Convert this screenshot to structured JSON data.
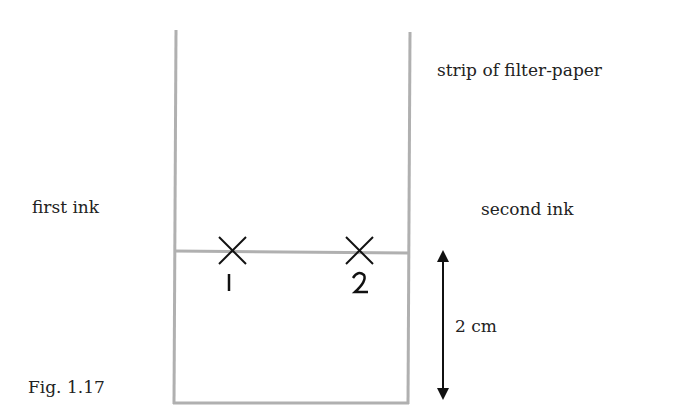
{
  "figure": {
    "caption": "Fig. 1.17",
    "labels": {
      "strip": "strip of filter-paper",
      "first_ink": "first ink",
      "second_ink": "second ink",
      "distance": "2 cm"
    },
    "marks": [
      {
        "symbol": "×",
        "number": "1"
      },
      {
        "symbol": "×",
        "number": "2"
      }
    ],
    "colors": {
      "paper_outline": "#b0b0b0",
      "arrow": "#111111",
      "text": "#222222"
    }
  }
}
